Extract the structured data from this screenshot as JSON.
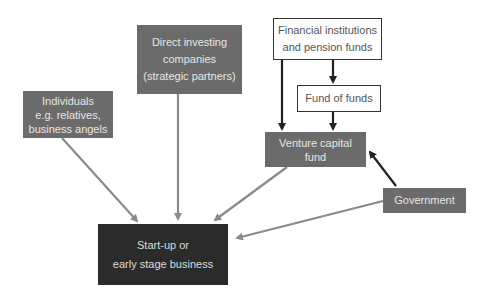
{
  "diagram": {
    "nodes": {
      "individuals": {
        "lines": [
          "Individuals",
          "e.g. relatives,",
          "business angels"
        ]
      },
      "direct_investing": {
        "lines": [
          "Direct investing",
          "companies",
          "(strategic partners)"
        ]
      },
      "financial_institutions": {
        "lines": [
          "Financial institutions",
          "and pension funds"
        ]
      },
      "fund_of_funds": {
        "lines": [
          "Fund of funds"
        ]
      },
      "venture_capital": {
        "lines": [
          "Venture capital",
          "fund"
        ]
      },
      "government": {
        "lines": [
          "Government"
        ]
      },
      "startup": {
        "lines": [
          "Start-up or",
          "early stage business"
        ]
      }
    },
    "edges": [
      {
        "from": "Individuals",
        "to": "Start-up or early stage business",
        "color": "#8a8a8a"
      },
      {
        "from": "Direct investing companies",
        "to": "Start-up or early stage business",
        "color": "#8a8a8a"
      },
      {
        "from": "Venture capital fund",
        "to": "Start-up or early stage business",
        "color": "#8a8a8a"
      },
      {
        "from": "Government",
        "to": "Start-up or early stage business",
        "color": "#8a8a8a"
      },
      {
        "from": "Financial institutions and pension funds",
        "to": "Venture capital fund",
        "color": "#222222"
      },
      {
        "from": "Financial institutions and pension funds",
        "to": "Fund of funds",
        "color": "#222222"
      },
      {
        "from": "Fund of funds",
        "to": "Venture capital fund",
        "color": "#222222"
      },
      {
        "from": "Government",
        "to": "Venture capital fund",
        "color": "#222222"
      }
    ],
    "colors": {
      "grey_box": "#6b6b6b",
      "dark_box": "#2b2b2b",
      "grey_arrow": "#8a8a8a",
      "dark_arrow": "#222222"
    }
  }
}
